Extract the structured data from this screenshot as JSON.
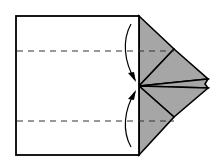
{
  "diagram": {
    "type": "origami-fold-step",
    "colors": {
      "paper_front": "#ffffff",
      "paper_back": "#a6a6a6",
      "line": "#000000",
      "dash": "#333333"
    },
    "fold_lines": [
      {
        "name": "upper-valley-fold",
        "y": 51
      },
      {
        "name": "lower-valley-fold",
        "y": 121
      }
    ],
    "arrows": [
      {
        "name": "fold-down-arrow",
        "direction": "down"
      },
      {
        "name": "fold-up-arrow",
        "direction": "up"
      }
    ]
  }
}
